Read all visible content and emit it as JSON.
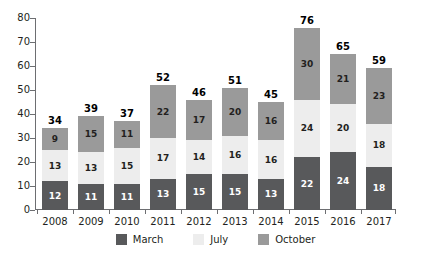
{
  "chart_data": {
    "type": "bar",
    "subtype": "stacked-bar",
    "title": "",
    "xlabel": "",
    "ylabel": "",
    "ylim": [
      0,
      80
    ],
    "yticks": [
      0,
      10,
      20,
      30,
      40,
      50,
      60,
      70,
      80
    ],
    "grid": false,
    "legend_position": "bottom",
    "categories": [
      "2008",
      "2009",
      "2010",
      "2011",
      "2012",
      "2013",
      "2014",
      "2015",
      "2016",
      "2017"
    ],
    "series": [
      {
        "name": "March",
        "color": "#58595b",
        "values": [
          12,
          11,
          11,
          13,
          15,
          15,
          13,
          22,
          24,
          18
        ]
      },
      {
        "name": "July",
        "color": "#ededed",
        "values": [
          13,
          13,
          15,
          17,
          14,
          16,
          16,
          24,
          20,
          18
        ]
      },
      {
        "name": "October",
        "color": "#9a9a9a",
        "values": [
          9,
          15,
          11,
          22,
          17,
          20,
          16,
          30,
          21,
          23
        ]
      }
    ],
    "totals": [
      34,
      39,
      37,
      52,
      46,
      51,
      45,
      76,
      65,
      59
    ]
  },
  "axis": {
    "y_tick_labels": [
      "80",
      "70",
      "60",
      "50",
      "40",
      "30",
      "20",
      "10",
      "0"
    ],
    "x_tick_labels": [
      "2008",
      "2009",
      "2010",
      "2011",
      "2012",
      "2013",
      "2014",
      "2015",
      "2016",
      "2017"
    ]
  },
  "legend": {
    "items": [
      {
        "label": "March",
        "color": "#58595b"
      },
      {
        "label": "July",
        "color": "#ededed"
      },
      {
        "label": "October",
        "color": "#9a9a9a"
      }
    ]
  }
}
